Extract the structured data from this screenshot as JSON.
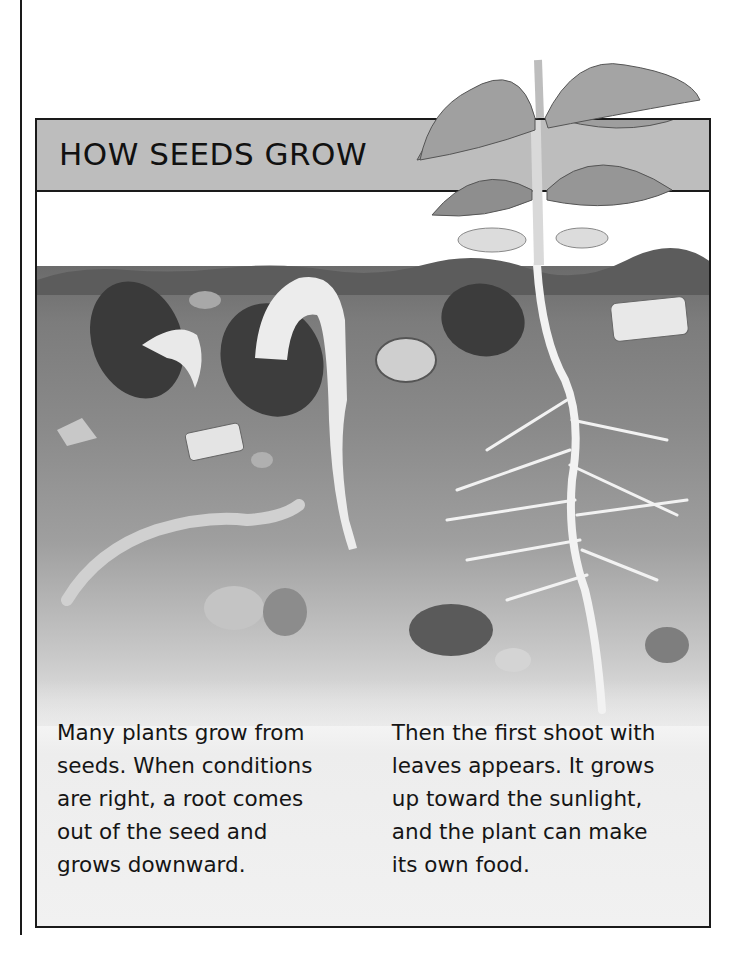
{
  "page": {
    "title": "HOW SEEDS GROW",
    "captions": {
      "left": {
        "lines": [
          "Many plants grow from",
          "seeds. When conditions",
          "are right, a root comes",
          "out of the seed and",
          "grows downward."
        ]
      },
      "right": {
        "lines": [
          "Then the first shoot with",
          "leaves appears. It grows",
          "up toward the sunlight,",
          "and the plant can make",
          "its own food."
        ]
      }
    },
    "illustration": {
      "description": "Cross-section of soil showing germinating bean seeds, an earthworm, stones, and a young bean plant with leaves above ground and branching roots below",
      "elements": [
        "bean-seed-with-root",
        "bean-seed-sprouting-shoot",
        "bean-seed-dormant",
        "earthworm",
        "stones",
        "pottery-shards",
        "young-bean-plant",
        "branching-roots"
      ]
    },
    "colors": {
      "title_bar": "#bdbdbd",
      "frame_border": "#1a1a1a",
      "soil_dark": "#6b6b6b",
      "caption_bg": "#f0f0f0"
    }
  }
}
